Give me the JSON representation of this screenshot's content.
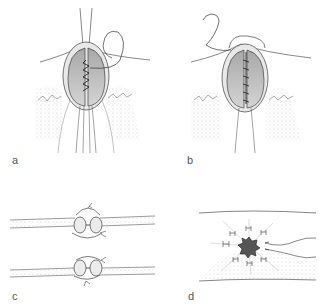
{
  "figure": {
    "panels": [
      {
        "id": "a",
        "label": "a",
        "description": "closed wound with running suture, needle thread loop exiting upper right"
      },
      {
        "id": "b",
        "label": "b",
        "description": "closed wound with running suture, free thread end at upper left"
      },
      {
        "id": "c",
        "label": "c",
        "description": "cross-section of two tissue layers with inverting/everting sutures"
      },
      {
        "id": "d",
        "label": "d",
        "description": "purse-string closure around central defect, thread ends exiting right"
      }
    ]
  },
  "colors": {
    "line": "#3a3a3a",
    "tissue_fill": "#b8b8b8",
    "stipple": "#c8c8c8",
    "background": "#ffffff",
    "defect_fill": "#555555"
  }
}
